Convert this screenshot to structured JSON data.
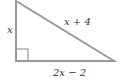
{
  "diagram": {
    "type": "right-triangle",
    "stroke_color": "#9a9a9a",
    "text_color": "#333333",
    "vertices": {
      "top": [
        16,
        1
      ],
      "right_angle": [
        16,
        61
      ],
      "bottom_right": [
        114,
        61
      ]
    },
    "labels": {
      "vertical_leg": "x",
      "hypotenuse": "x + 4",
      "horizontal_leg": "2x − 2"
    },
    "right_angle_marker": true
  }
}
